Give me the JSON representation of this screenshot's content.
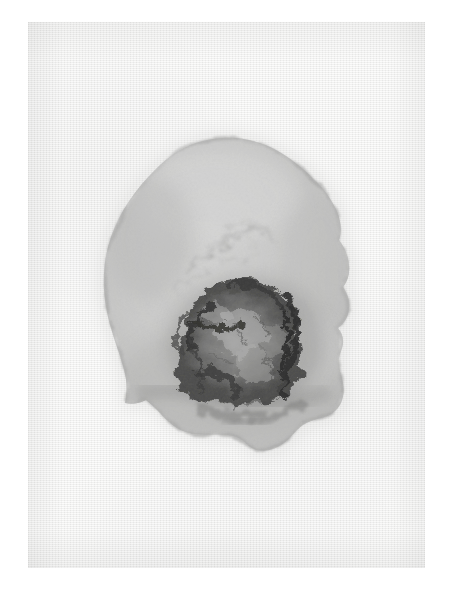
{
  "artwork": {
    "title": "Untitled Ink Blot on Laid Paper",
    "medium": "ink and watercolour wash on textured paper",
    "orientation": "portrait",
    "canvas": {
      "width": 451,
      "height": 597,
      "background_color": "#ffffff"
    },
    "paper": {
      "name": "paper-sheet",
      "left": 28,
      "top": 22,
      "width": 397,
      "height": 546,
      "base_color": "#f3f3f2",
      "texture": "horizontal laid ribbing with faint vertical chain lines",
      "texture_line_spacing_px": 2
    },
    "blot": {
      "name": "ink-blot",
      "shape": "irregular rounded mass, lobed lower edge",
      "center_x": 222,
      "center_y": 293,
      "bounds": {
        "left": 103,
        "top": 137,
        "right": 345,
        "bottom": 450
      },
      "width": 242,
      "height": 313,
      "wash_color": "#c2c2c1",
      "wash_edge_color": "#a8a8a7",
      "core_color": "#3a3a39",
      "core_darkest_color": "#141414",
      "core": {
        "name": "dark-core",
        "center_x": 218,
        "center_y": 320,
        "width": 135,
        "height": 125,
        "description": "mottled charcoal mass with near-black tendrils on the left and a sharp dark ridge on the right"
      },
      "features": [
        {
          "name": "upper-wisp-streaks",
          "x": 205,
          "y": 225,
          "tone": "#b0b0af",
          "description": "faint diagonal wisps in the upper wash"
        },
        {
          "name": "left-claw-tendril",
          "x": 172,
          "y": 312,
          "tone": "#1d1d1c",
          "description": "claw-shaped dark tendril reserving a lighter shape"
        },
        {
          "name": "right-ridge",
          "x": 262,
          "y": 315,
          "tone": "#141414",
          "description": "near-black vertical ridge bounding the core on the right"
        },
        {
          "name": "lower-dark-band",
          "x": 215,
          "y": 392,
          "tone": "#6e6e6d",
          "description": "horizontal darker band across the lower blot"
        },
        {
          "name": "bottom-lobe",
          "x": 265,
          "y": 435,
          "tone": "#b5b5b4",
          "description": "rounded lobe protruding at the bottom"
        },
        {
          "name": "lower-left-facet",
          "x": 140,
          "y": 400,
          "tone": "#b8b8b7",
          "description": "angular straight-edged facet at the lower left"
        }
      ]
    }
  }
}
